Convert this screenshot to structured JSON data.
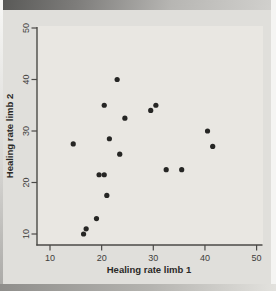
{
  "figure": {
    "xlabel": "Healing rate limb 1",
    "ylabel": "Healing rate limb 2"
  },
  "chart_data": {
    "type": "scatter",
    "title": "",
    "xlabel": "Healing rate limb 1",
    "ylabel": "Healing rate limb 2",
    "xlim": [
      10,
      50
    ],
    "ylim": [
      10,
      50
    ],
    "xticks": [
      10,
      20,
      30,
      40,
      50
    ],
    "yticks": [
      10,
      20,
      30,
      40,
      50
    ],
    "grid": false,
    "legend": false,
    "points": [
      [
        23,
        40
      ],
      [
        20.5,
        35
      ],
      [
        30.5,
        35
      ],
      [
        29.5,
        34
      ],
      [
        24.5,
        32.5
      ],
      [
        40.5,
        30
      ],
      [
        21.5,
        28.5
      ],
      [
        14.5,
        27.5
      ],
      [
        41.5,
        27
      ],
      [
        23.5,
        25.5
      ],
      [
        32.5,
        22.5
      ],
      [
        35.5,
        22.5
      ],
      [
        19.5,
        21.5
      ],
      [
        20.5,
        21.5
      ],
      [
        21,
        17.5
      ],
      [
        19,
        13
      ],
      [
        17,
        11
      ],
      [
        16.5,
        10
      ]
    ],
    "point_color": "#262624",
    "axis_color": "#4b4a47",
    "panel_color": "#e9e7e2",
    "background_color": "#e0dfdb"
  }
}
